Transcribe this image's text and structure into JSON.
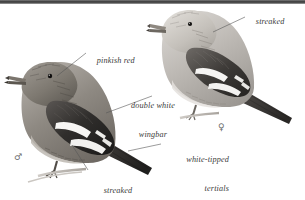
{
  "plate": {
    "title": "White-winged Crossbill plate",
    "background_color": "#ffffff",
    "top_bar_color": "#3a3a3a",
    "ink_color": "#3b3b3b",
    "width": 305,
    "height": 200
  },
  "annotations": [
    {
      "id": "pinkish-red",
      "line1": "pinkish red",
      "line2": "",
      "align": "left",
      "x": 88,
      "y": 50
    },
    {
      "id": "double-white-wingbar",
      "line1": "double white",
      "line2": "wingbar",
      "align": "center",
      "x": 116,
      "y": 86
    },
    {
      "id": "streaked",
      "line1": "streaked",
      "line2": "",
      "align": "left",
      "x": 247,
      "y": 11
    },
    {
      "id": "white-tipped-tertials",
      "line1": "white-tipped",
      "line2": "tertials",
      "align": "right",
      "x": 163,
      "y": 140
    },
    {
      "id": "streaked-flanks",
      "line1": "streaked",
      "line2": "flanks",
      "align": "center",
      "x": 90,
      "y": 171
    }
  ],
  "gender_marks": [
    {
      "id": "male",
      "symbol": "♂",
      "x": 14,
      "y": 152
    },
    {
      "id": "female",
      "symbol": "♀",
      "x": 218,
      "y": 122
    }
  ],
  "birds": [
    {
      "id": "male-crossbill",
      "caption": "♂",
      "plumage": "darker, pinkish red"
    },
    {
      "id": "female-crossbill",
      "caption": "♀",
      "plumage": "paler, streaked"
    }
  ]
}
